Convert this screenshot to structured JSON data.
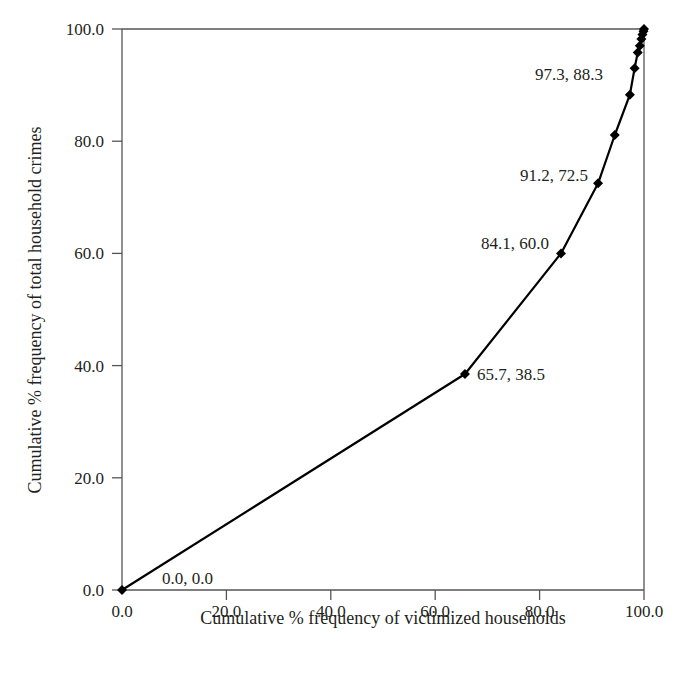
{
  "chart_data": {
    "type": "line",
    "title": "",
    "xlabel": "Cumulative % frequency of victimized households",
    "ylabel": "Cumulative % frequency of total household crimes",
    "xlim": [
      0,
      100
    ],
    "ylim": [
      0,
      100
    ],
    "grid": false,
    "legend": null,
    "x_ticks": [
      "0.0",
      "20.0",
      "40.0",
      "60.0",
      "80.0",
      "100.0"
    ],
    "y_ticks": [
      "0.0",
      "20.0",
      "40.0",
      "60.0",
      "80.0",
      "100.0"
    ],
    "series": [
      {
        "name": "Cumulative curve",
        "marker": "diamond",
        "color": "#000000",
        "x": [
          0.0,
          65.7,
          84.1,
          91.2,
          94.4,
          97.3,
          98.2,
          98.8,
          99.2,
          99.5,
          99.7,
          99.9,
          100.0
        ],
        "y": [
          0.0,
          38.5,
          60.0,
          72.5,
          81.1,
          88.3,
          93.0,
          95.8,
          97.0,
          98.2,
          99.0,
          99.6,
          100.0
        ]
      }
    ],
    "annotations": [
      {
        "text": "0.0, 0.0",
        "x": 0.0,
        "y": 0.0
      },
      {
        "text": "65.7, 38.5",
        "x": 65.7,
        "y": 38.5
      },
      {
        "text": "84.1, 60.0",
        "x": 84.1,
        "y": 60.0
      },
      {
        "text": "91.2, 72.5",
        "x": 91.2,
        "y": 72.5
      },
      {
        "text": "97.3, 88.3",
        "x": 97.3,
        "y": 88.3
      }
    ]
  }
}
